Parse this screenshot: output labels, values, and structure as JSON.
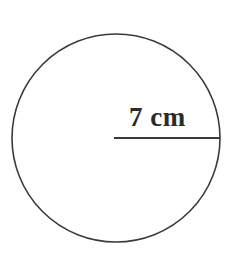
{
  "figure": {
    "type": "geometry-diagram",
    "shape": "circle",
    "background_color": "#ffffff",
    "stroke_color": "#3a3a3a",
    "label_color": "#2b2b2b",
    "radius_label": "7 cm",
    "measurement": {
      "quantity": "radius",
      "value": 7,
      "unit": "cm",
      "text": "7 cm"
    },
    "circle": {
      "center_x": 116,
      "center_y": 138,
      "radius_px": 104,
      "stroke_width": 1.6
    },
    "radius_line": {
      "x1": 114,
      "y1": 138,
      "x2": 220,
      "y2": 138,
      "stroke_width": 2
    }
  }
}
